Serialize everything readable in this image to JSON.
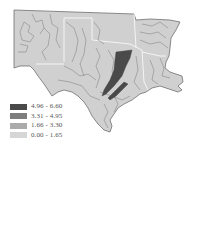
{
  "map": {
    "type": "choropleth",
    "region": "South-central United States",
    "base_fill": "#d0d0d0",
    "boundary_stroke": "#6a6a6a",
    "state_border_stroke": "#f2f2f2",
    "highlight_fill": "#4a4a4a"
  },
  "legend": {
    "items": [
      {
        "label": "4.96 - 6.60",
        "color": "#4a4a4a"
      },
      {
        "label": "3.31 - 4.95",
        "color": "#7e7e7e"
      },
      {
        "label": "1.66 - 3.30",
        "color": "#ababab"
      },
      {
        "label": "0.00 - 1.65",
        "color": "#d6d6d6"
      }
    ]
  }
}
